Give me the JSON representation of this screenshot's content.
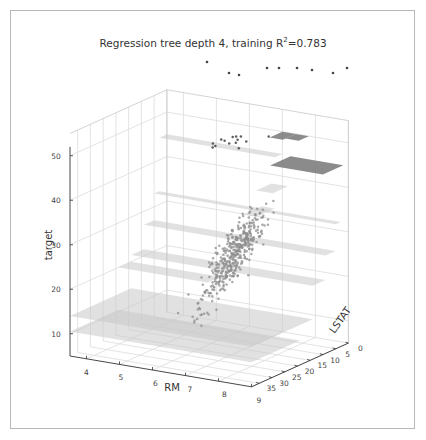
{
  "chart_data": {
    "type": "scatter3d",
    "title": "Regression tree depth 4, training R",
    "title_sup": "2",
    "title_suffix": "=0.783",
    "xlabel": "RM",
    "ylabel": "LSTAT",
    "zlabel": "target",
    "x_ticks": [
      "4",
      "5",
      "6",
      "7",
      "8",
      "9"
    ],
    "y_ticks": [
      "0",
      "5",
      "10",
      "15",
      "20",
      "25",
      "30",
      "35"
    ],
    "z_ticks": [
      "10",
      "20",
      "30",
      "40",
      "50"
    ],
    "xlim": [
      3.5,
      9
    ],
    "ylim": [
      0,
      38
    ],
    "zlim": [
      5,
      50
    ],
    "grid": true,
    "point_color": "#8c8c8c",
    "plane_color_light": "#c8c8c8",
    "plane_color_dark": "#777777",
    "planes": [
      {
        "rm": [
          3.5,
          9
        ],
        "lstat": [
          14,
          38
        ],
        "target": 14.0,
        "shade": "light"
      },
      {
        "rm": [
          3.5,
          9
        ],
        "lstat": [
          19,
          38
        ],
        "target": 10.5,
        "shade": "light"
      },
      {
        "rm": [
          3.5,
          6.2
        ],
        "lstat": [
          14,
          19
        ],
        "target": 20.0,
        "shade": "light"
      },
      {
        "rm": [
          3.5,
          9
        ],
        "lstat": [
          9,
          14
        ],
        "target": 21.5,
        "shade": "light"
      },
      {
        "rm": [
          3.5,
          9
        ],
        "lstat": [
          5,
          9
        ],
        "target": 27.0,
        "shade": "light"
      },
      {
        "rm": [
          3.5,
          9
        ],
        "lstat": [
          3,
          5
        ],
        "target": 33.0,
        "shade": "light"
      },
      {
        "rm": [
          6.6,
          7.0
        ],
        "lstat": [
          3,
          10
        ],
        "target": 33.5,
        "shade": "light"
      },
      {
        "rm": [
          6.9,
          7.4
        ],
        "lstat": [
          3,
          9
        ],
        "target": 39.0,
        "shade": "light"
      },
      {
        "rm": [
          3.5,
          7.0
        ],
        "lstat": [
          0,
          3
        ],
        "target": 45.0,
        "shade": "light"
      },
      {
        "rm": [
          7.4,
          9
        ],
        "lstat": [
          2,
          10
        ],
        "target": 45.5,
        "shade": "dark"
      },
      {
        "rm": [
          7.0,
          7.4
        ],
        "lstat": [
          0,
          5
        ],
        "target": 50.0,
        "shade": "dark"
      },
      {
        "rm": [
          7.4,
          7.8
        ],
        "lstat": [
          0,
          4
        ],
        "target": 50.0,
        "shade": "dark"
      }
    ]
  }
}
